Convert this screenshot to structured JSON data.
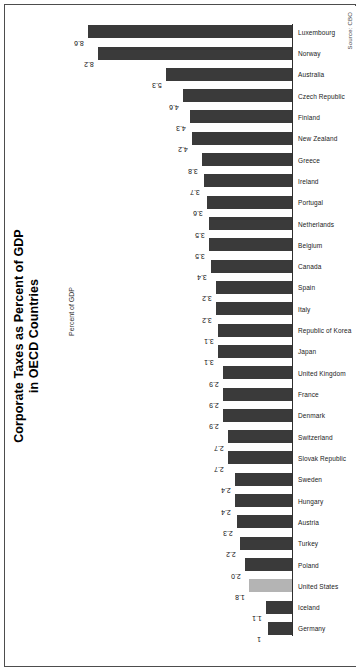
{
  "figure": {
    "title_line1": "Corporate Taxes as Percent of GDP",
    "title_line2": "in OECD Countries",
    "axis_label": "Percent of GDP",
    "source": "Source: CBO"
  },
  "chart_data": {
    "type": "bar",
    "title": "Corporate Taxes as Percent of GDP in OECD Countries",
    "xlabel": "",
    "ylabel": "Percent of GDP",
    "ylim": [
      0,
      8.6
    ],
    "grid": false,
    "legend": null,
    "highlight_category": "United States",
    "highlight_color": "#b4b4b4",
    "bar_color": "#3a3a3a",
    "categories": [
      "Germany",
      "Iceland",
      "United States",
      "Poland",
      "Turkey",
      "Austria",
      "Hungary",
      "Sweden",
      "Slovak Republic",
      "Switzerland",
      "Denmark",
      "France",
      "United Kingdom",
      "Japan",
      "Republic of Korea",
      "Italy",
      "Spain",
      "Canada",
      "Belgium",
      "Netherlands",
      "Portugal",
      "Ireland",
      "Greece",
      "New Zealand",
      "Finland",
      "Czech Republic",
      "Australia",
      "Norway",
      "Luxembourg"
    ],
    "values": [
      1,
      1.1,
      1.8,
      2.0,
      2.2,
      2.3,
      2.4,
      2.4,
      2.7,
      2.7,
      2.9,
      2.9,
      2.9,
      3.1,
      3.1,
      3.2,
      3.2,
      3.4,
      3.5,
      3.5,
      3.6,
      3.7,
      3.8,
      4.2,
      4.3,
      4.6,
      5.3,
      8.2,
      8.6
    ],
    "value_labels": [
      "1",
      "1.1",
      "1.8",
      "2.0",
      "2.2",
      "2.3",
      "2.4",
      "2.4",
      "2.7",
      "2.7",
      "2.9",
      "2.9",
      "2.9",
      "3.1",
      "3.1",
      "3.2",
      "3.2",
      "3.4",
      "3.5",
      "3.5",
      "3.6",
      "3.7",
      "3.8",
      "4.2",
      "4.3",
      "4.6",
      "5.3",
      "8.2",
      "8.6"
    ]
  }
}
